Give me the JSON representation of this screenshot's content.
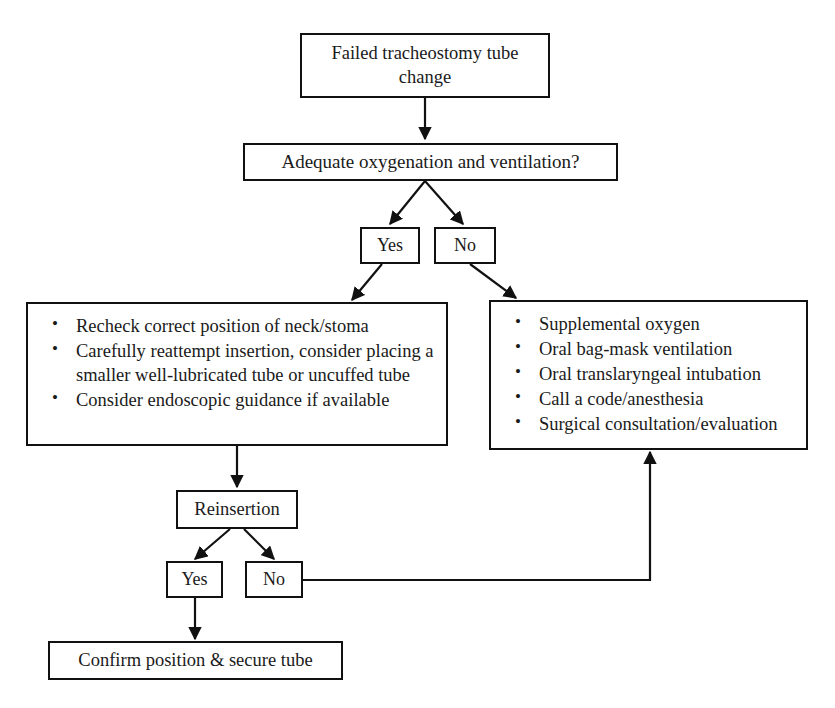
{
  "diagram": {
    "colors": {
      "background": "#ffffff",
      "stroke": "#111111",
      "text": "#1a1a1a"
    },
    "nodes": {
      "start": {
        "label": "Failed tracheostomy tube\nchange"
      },
      "decision_oxygenation": {
        "label": "Adequate oxygenation and ventilation?"
      },
      "yes_top": {
        "label": "Yes"
      },
      "no_top": {
        "label": "No"
      },
      "left_actions": {
        "items": [
          "Recheck correct position of neck/stoma",
          "Carefully reattempt insertion, consider placing a smaller well-lubricated tube or uncuffed tube",
          "Consider endoscopic guidance if available"
        ]
      },
      "right_actions": {
        "items": [
          "Supplemental oxygen",
          "Oral bag-mask ventilation",
          "Oral translaryngeal intubation",
          "Call a code/anesthesia",
          "Surgical consultation/evaluation"
        ]
      },
      "reinsertion": {
        "label": "Reinsertion"
      },
      "yes_bottom": {
        "label": "Yes"
      },
      "no_bottom": {
        "label": "No"
      },
      "confirm": {
        "label": "Confirm position & secure tube"
      }
    },
    "edges": [
      {
        "name": "start-to-decision",
        "from": "start",
        "to": "decision_oxygenation",
        "label": ""
      },
      {
        "name": "decision-to-yes",
        "from": "decision_oxygenation",
        "to": "yes_top",
        "label": ""
      },
      {
        "name": "decision-to-no",
        "from": "decision_oxygenation",
        "to": "no_top",
        "label": ""
      },
      {
        "name": "yes-to-left-actions",
        "from": "yes_top",
        "to": "left_actions",
        "label": ""
      },
      {
        "name": "no-to-right-actions",
        "from": "no_top",
        "to": "right_actions",
        "label": ""
      },
      {
        "name": "left-actions-to-reinsertion",
        "from": "left_actions",
        "to": "reinsertion",
        "label": ""
      },
      {
        "name": "reinsertion-to-yes",
        "from": "reinsertion",
        "to": "yes_bottom",
        "label": ""
      },
      {
        "name": "reinsertion-to-no",
        "from": "reinsertion",
        "to": "no_bottom",
        "label": ""
      },
      {
        "name": "yes-to-confirm",
        "from": "yes_bottom",
        "to": "confirm",
        "label": ""
      },
      {
        "name": "no-to-right-actions-return",
        "from": "no_bottom",
        "to": "right_actions",
        "label": ""
      }
    ]
  }
}
